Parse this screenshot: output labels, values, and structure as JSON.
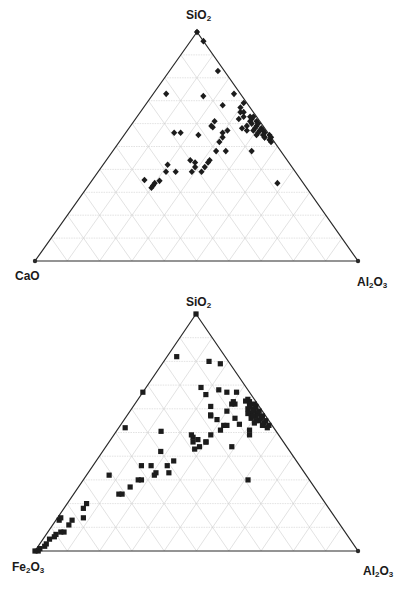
{
  "colors": {
    "frame": "#2a2a2a",
    "grid": "#cfcfcf",
    "marker": "#1c1c1c",
    "label": "#1a1a1a"
  },
  "chart_data": [
    {
      "type": "scatter",
      "subtype": "ternary",
      "title": "",
      "apices": {
        "top": "SiO2",
        "left": "CaO",
        "right": "Al2O3"
      },
      "apex_labels": {
        "top": {
          "main": "SiO",
          "sub": "2",
          "tail": ""
        },
        "left": {
          "main": "CaO",
          "sub": "",
          "tail": ""
        },
        "right": {
          "main": "Al",
          "sub": "2",
          "tail": "O",
          "sub2": "3"
        }
      },
      "marker": "diamond",
      "grid_divisions": 10,
      "point_order": [
        "SiO2",
        "CaO",
        "Al2O3"
      ],
      "points": [
        [
          100,
          0,
          0
        ],
        [
          96,
          0,
          4
        ],
        [
          83,
          2,
          15
        ],
        [
          73,
          23,
          4
        ],
        [
          72,
          12,
          16
        ],
        [
          73,
          2,
          25
        ],
        [
          68,
          8,
          24
        ],
        [
          69,
          1,
          30
        ],
        [
          65,
          4,
          31
        ],
        [
          59,
          16,
          26
        ],
        [
          59,
          16,
          25
        ],
        [
          61,
          14,
          25
        ],
        [
          56,
          29,
          15
        ],
        [
          56,
          27,
          17
        ],
        [
          55,
          22,
          23
        ],
        [
          56,
          14,
          30
        ],
        [
          57,
          12,
          31
        ],
        [
          52,
          17,
          31
        ],
        [
          54,
          15,
          31
        ],
        [
          48,
          20,
          32
        ],
        [
          44,
          24,
          32
        ],
        [
          48,
          17,
          35
        ],
        [
          43,
          25,
          32
        ],
        [
          41,
          27,
          32
        ],
        [
          43,
          29,
          28
        ],
        [
          41,
          30,
          29
        ],
        [
          44,
          30,
          26
        ],
        [
          39,
          32,
          29
        ],
        [
          39,
          29,
          32
        ],
        [
          42,
          38,
          20
        ],
        [
          39,
          40,
          21
        ],
        [
          39,
          37,
          24
        ],
        [
          35,
          48,
          16
        ],
        [
          33,
          47,
          20
        ],
        [
          35,
          44,
          21
        ],
        [
          34,
          46,
          20
        ],
        [
          32,
          48,
          20
        ],
        [
          48,
          9,
          43
        ],
        [
          34,
          8,
          58
        ],
        [
          63,
          2,
          35
        ],
        [
          62,
          2,
          36
        ],
        [
          63,
          1,
          36
        ],
        [
          61,
          3,
          36
        ],
        [
          61,
          1,
          38
        ],
        [
          60,
          3,
          37
        ],
        [
          59,
          2,
          39
        ],
        [
          60,
          1,
          39
        ],
        [
          58,
          1,
          41
        ],
        [
          58,
          3,
          39
        ],
        [
          57,
          1,
          42
        ],
        [
          57,
          2,
          41
        ],
        [
          56,
          3,
          41
        ],
        [
          56,
          1,
          43
        ],
        [
          55,
          2,
          43
        ],
        [
          55,
          0,
          45
        ],
        [
          54,
          0,
          46
        ],
        [
          54,
          2,
          44
        ],
        [
          53,
          1,
          46
        ],
        [
          57,
          4,
          39
        ],
        [
          59,
          5,
          36
        ],
        [
          58,
          7,
          35
        ],
        [
          57,
          6,
          37
        ],
        [
          55,
          4,
          41
        ],
        [
          54,
          2,
          44
        ],
        [
          52,
          1,
          47
        ],
        [
          65,
          3,
          32
        ],
        [
          63,
          4,
          33
        ],
        [
          67,
          3,
          30
        ],
        [
          62,
          6,
          32
        ]
      ]
    },
    {
      "type": "scatter",
      "subtype": "ternary",
      "title": "",
      "apices": {
        "top": "SiO2",
        "left": "Fe2O3",
        "right": "Al2O3"
      },
      "apex_labels": {
        "top": {
          "main": "SiO",
          "sub": "2",
          "tail": ""
        },
        "left": {
          "main": "Fe",
          "sub": "2",
          "tail": "O",
          "sub2": "3"
        },
        "right": {
          "main": "Al",
          "sub": "2",
          "tail": "O",
          "sub2": "3"
        }
      },
      "marker": "square",
      "grid_divisions": 10,
      "point_order": [
        "SiO2",
        "Fe2O3",
        "Al2O3"
      ],
      "points": [
        [
          100,
          0,
          0
        ],
        [
          82,
          15,
          3
        ],
        [
          80,
          6,
          14
        ],
        [
          79,
          3,
          18
        ],
        [
          67,
          33,
          0
        ],
        [
          51,
          36,
          14
        ],
        [
          69,
          14,
          17
        ],
        [
          66,
          14,
          20
        ],
        [
          68,
          9,
          23
        ],
        [
          67,
          7,
          26
        ],
        [
          67,
          4,
          29
        ],
        [
          62,
          3,
          33
        ],
        [
          62,
          7,
          31
        ],
        [
          59,
          11,
          30
        ],
        [
          62,
          8,
          30
        ],
        [
          63,
          7,
          30
        ],
        [
          58,
          4,
          38
        ],
        [
          61,
          15,
          24
        ],
        [
          58,
          17,
          26
        ],
        [
          57,
          17,
          26
        ],
        [
          56,
          16,
          29
        ],
        [
          53,
          14,
          33
        ],
        [
          56,
          10,
          34
        ],
        [
          54,
          10,
          37
        ],
        [
          51,
          8,
          41
        ],
        [
          49,
          9,
          42
        ],
        [
          44,
          17,
          39
        ],
        [
          30,
          19,
          51
        ],
        [
          49,
          27,
          24
        ],
        [
          48,
          27,
          25
        ],
        [
          46,
          28,
          26
        ],
        [
          43,
          29,
          28
        ],
        [
          44,
          27,
          29
        ],
        [
          46,
          24,
          30
        ],
        [
          49,
          21,
          30
        ],
        [
          51,
          17,
          32
        ],
        [
          53,
          15,
          32
        ],
        [
          46,
          24,
          30
        ],
        [
          47,
          26,
          27
        ],
        [
          42,
          40,
          18
        ],
        [
          36,
          49,
          15
        ],
        [
          36,
          46,
          18
        ],
        [
          36,
          41,
          23
        ],
        [
          38,
          38,
          24
        ],
        [
          33,
          46,
          21
        ],
        [
          32,
          47,
          21
        ],
        [
          33,
          42,
          25
        ],
        [
          32,
          61,
          7
        ],
        [
          30,
          53,
          17
        ],
        [
          30,
          52,
          18
        ],
        [
          27,
          57,
          16
        ],
        [
          24,
          61,
          15
        ],
        [
          24,
          62,
          14
        ],
        [
          20,
          74,
          6
        ],
        [
          18,
          76,
          6
        ],
        [
          13,
          82,
          5
        ],
        [
          11,
          84,
          5
        ],
        [
          14,
          78,
          8
        ],
        [
          8,
          88,
          4
        ],
        [
          7,
          90,
          3
        ],
        [
          8,
          87,
          5
        ],
        [
          6,
          91,
          3
        ],
        [
          5,
          93,
          2
        ],
        [
          3,
          95,
          2
        ],
        [
          2,
          96,
          2
        ],
        [
          1,
          98,
          1
        ],
        [
          0,
          99,
          1
        ],
        [
          0,
          100,
          0
        ],
        [
          13,
          86,
          1
        ],
        [
          14,
          85,
          1
        ],
        [
          52,
          46,
          2
        ],
        [
          61,
          1,
          38
        ],
        [
          60,
          2,
          38
        ],
        [
          59,
          1,
          40
        ],
        [
          58,
          2,
          40
        ],
        [
          57,
          1,
          42
        ],
        [
          57,
          3,
          40
        ],
        [
          56,
          2,
          42
        ],
        [
          55,
          1,
          44
        ],
        [
          55,
          3,
          42
        ],
        [
          54,
          2,
          44
        ],
        [
          53,
          1,
          46
        ],
        [
          53,
          3,
          44
        ],
        [
          52,
          2,
          46
        ],
        [
          60,
          4,
          36
        ],
        [
          58,
          5,
          37
        ],
        [
          56,
          5,
          39
        ],
        [
          54,
          5,
          41
        ],
        [
          59,
          3,
          38
        ],
        [
          57,
          4,
          39
        ],
        [
          55,
          4,
          41
        ],
        [
          63,
          2,
          35
        ],
        [
          62,
          1,
          37
        ],
        [
          64,
          2,
          34
        ],
        [
          61,
          3,
          36
        ]
      ]
    }
  ]
}
